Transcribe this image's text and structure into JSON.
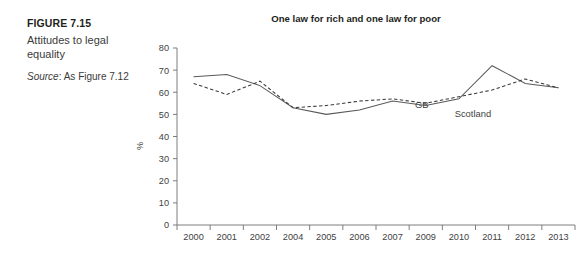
{
  "caption": {
    "figure_number": "FIGURE 7.15",
    "title": "Attitudes to legal equality",
    "source_label": "Source",
    "source_text": ": As Figure 7.12"
  },
  "chart_data": {
    "type": "line",
    "title": "One law for rich and one law for poor",
    "xlabel": "",
    "ylabel": "%",
    "ylim": [
      0,
      80
    ],
    "yticks": [
      0,
      10,
      20,
      30,
      40,
      50,
      60,
      70,
      80
    ],
    "grid": false,
    "legend_position": "inline-annotations",
    "categories": [
      "2000",
      "2001",
      "2002",
      "2004",
      "2005",
      "2006",
      "2007",
      "2009",
      "2010",
      "2011",
      "2012",
      "2013"
    ],
    "series": [
      {
        "name": "GB",
        "style": "solid",
        "color": "#595959",
        "values": [
          67,
          68,
          63,
          53,
          50,
          52,
          56,
          54,
          57,
          72,
          64,
          62
        ],
        "annotation": "GB"
      },
      {
        "name": "Scotland",
        "style": "dashed",
        "color": "#3a3a3a",
        "values": [
          64,
          59,
          65,
          53,
          54,
          56,
          57,
          55,
          58,
          61,
          66,
          62
        ],
        "annotation": "Scotland"
      }
    ],
    "annotations": [
      {
        "text": "GB",
        "x": 0,
        "y": 0
      },
      {
        "text": "Scotland",
        "x": 0,
        "y": 0
      }
    ]
  }
}
